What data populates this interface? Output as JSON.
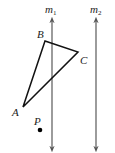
{
  "diagram": {
    "lines": [
      {
        "name": "m1",
        "label_main": "m",
        "label_sub": "1",
        "x": 52,
        "y1": 18,
        "y2": 151
      },
      {
        "name": "m2",
        "label_main": "m",
        "label_sub": "2",
        "x": 96,
        "y1": 18,
        "y2": 151
      }
    ],
    "triangle": {
      "vertices": {
        "A": {
          "label": "A",
          "x": 23,
          "y": 107
        },
        "B": {
          "label": "B",
          "x": 45,
          "y": 41
        },
        "C": {
          "label": "C",
          "x": 78,
          "y": 52
        }
      }
    },
    "point": {
      "label": "P",
      "x": 40,
      "y": 130
    },
    "colors": {
      "line": "#555555",
      "triangle": "#111111",
      "text": "#222222"
    }
  }
}
